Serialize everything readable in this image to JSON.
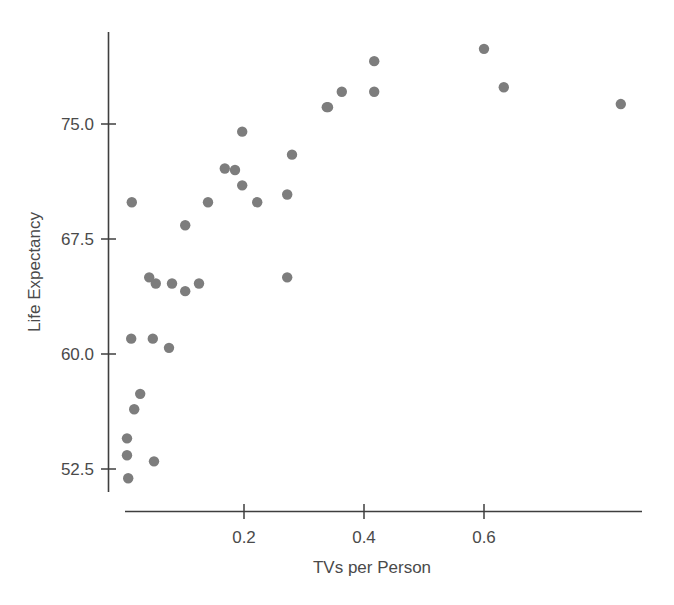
{
  "chart_data": {
    "type": "scatter",
    "title": "",
    "xlabel": "TVs per Person",
    "ylabel": "Life Expectancy",
    "xlim": [
      -0.02,
      0.865
    ],
    "ylim": [
      50.5,
      79.7
    ],
    "xticks": [
      0.2,
      0.4,
      0.6
    ],
    "xticklabels": [
      "0.2",
      "0.4",
      "0.6"
    ],
    "yticks": [
      52.5,
      60.0,
      67.5,
      75.0
    ],
    "yticklabels": [
      "52.5",
      "60.0",
      "67.5",
      "75.0"
    ],
    "grid": false,
    "legend": null,
    "marker_color": "#7d7d7d",
    "marker_size": 8,
    "points": [
      {
        "x": 0.013,
        "y": 69.9
      },
      {
        "x": 0.14,
        "y": 69.9
      },
      {
        "x": 0.102,
        "y": 68.4
      },
      {
        "x": 0.042,
        "y": 65.0
      },
      {
        "x": 0.053,
        "y": 64.6
      },
      {
        "x": 0.08,
        "y": 64.6
      },
      {
        "x": 0.102,
        "y": 64.1
      },
      {
        "x": 0.125,
        "y": 64.6
      },
      {
        "x": 0.012,
        "y": 61.0
      },
      {
        "x": 0.048,
        "y": 61.0
      },
      {
        "x": 0.075,
        "y": 60.4
      },
      {
        "x": 0.027,
        "y": 57.4
      },
      {
        "x": 0.017,
        "y": 56.4
      },
      {
        "x": 0.005,
        "y": 54.5
      },
      {
        "x": 0.005,
        "y": 53.4
      },
      {
        "x": 0.05,
        "y": 53.0
      },
      {
        "x": 0.007,
        "y": 51.9
      },
      {
        "x": 0.197,
        "y": 74.5
      },
      {
        "x": 0.338,
        "y": 76.1
      },
      {
        "x": 0.28,
        "y": 73.0
      },
      {
        "x": 0.168,
        "y": 72.1
      },
      {
        "x": 0.185,
        "y": 72.0
      },
      {
        "x": 0.197,
        "y": 71.0
      },
      {
        "x": 0.272,
        "y": 70.4
      },
      {
        "x": 0.222,
        "y": 69.9
      },
      {
        "x": 0.272,
        "y": 65.0
      },
      {
        "x": 0.34,
        "y": 76.1
      },
      {
        "x": 0.363,
        "y": 77.1
      },
      {
        "x": 0.417,
        "y": 79.1
      },
      {
        "x": 0.417,
        "y": 77.1
      },
      {
        "x": 0.6,
        "y": 79.9
      },
      {
        "x": 0.633,
        "y": 77.4
      },
      {
        "x": 0.828,
        "y": 76.3
      }
    ]
  }
}
